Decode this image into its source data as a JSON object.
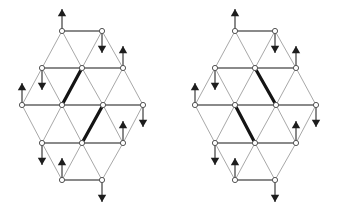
{
  "figure": {
    "canvas": {
      "width": 346,
      "height": 212,
      "background": "#ffffff"
    },
    "colors": {
      "edge_normal": "#a8a8a8",
      "edge_horizontal": "#8a8a8a",
      "edge_bold": "#141414",
      "node_fill": "#ffffff",
      "node_stroke": "#555555",
      "arrow": "#1d1d1d"
    },
    "geometry": {
      "node_radius": 2.6,
      "arrow_length": 22,
      "arrow_head_size": 4.2,
      "col_spacing": 20.3,
      "row_spacing": 18.5
    },
    "panels": [
      {
        "name": "left-lattice",
        "origin_x": 22,
        "origin_y": 31,
        "rows": [
          {
            "row": 0,
            "y": 31,
            "xs": [
              62,
              102
            ]
          },
          {
            "row": 1,
            "y": 68,
            "xs": [
              42,
              82,
              123
            ]
          },
          {
            "row": 2,
            "y": 105,
            "xs": [
              22,
              62,
              103,
              143
            ]
          },
          {
            "row": 3,
            "y": 143,
            "xs": [
              42,
              82,
              123
            ]
          },
          {
            "row": 4,
            "y": 180,
            "xs": [
              62,
              102
            ]
          }
        ],
        "horizontal_edges": [
          {
            "x1": 62,
            "y1": 31,
            "x2": 102,
            "y2": 31
          },
          {
            "x1": 42,
            "y1": 68,
            "x2": 123,
            "y2": 68
          },
          {
            "x1": 22,
            "y1": 105,
            "x2": 143,
            "y2": 105
          },
          {
            "x1": 42,
            "y1": 143,
            "x2": 123,
            "y2": 143
          },
          {
            "x1": 62,
            "y1": 180,
            "x2": 102,
            "y2": 180
          }
        ],
        "diagonal_edges": [
          {
            "x1": 62,
            "y1": 31,
            "x2": 42,
            "y2": 68
          },
          {
            "x1": 62,
            "y1": 31,
            "x2": 82,
            "y2": 68
          },
          {
            "x1": 102,
            "y1": 31,
            "x2": 82,
            "y2": 68
          },
          {
            "x1": 102,
            "y1": 31,
            "x2": 123,
            "y2": 68
          },
          {
            "x1": 42,
            "y1": 68,
            "x2": 22,
            "y2": 105
          },
          {
            "x1": 42,
            "y1": 68,
            "x2": 62,
            "y2": 105
          },
          {
            "x1": 82,
            "y1": 68,
            "x2": 62,
            "y2": 105
          },
          {
            "x1": 82,
            "y1": 68,
            "x2": 103,
            "y2": 105
          },
          {
            "x1": 123,
            "y1": 68,
            "x2": 103,
            "y2": 105
          },
          {
            "x1": 123,
            "y1": 68,
            "x2": 143,
            "y2": 105
          },
          {
            "x1": 22,
            "y1": 105,
            "x2": 42,
            "y2": 143
          },
          {
            "x1": 62,
            "y1": 105,
            "x2": 42,
            "y2": 143
          },
          {
            "x1": 62,
            "y1": 105,
            "x2": 82,
            "y2": 143
          },
          {
            "x1": 103,
            "y1": 105,
            "x2": 82,
            "y2": 143
          },
          {
            "x1": 103,
            "y1": 105,
            "x2": 123,
            "y2": 143
          },
          {
            "x1": 143,
            "y1": 105,
            "x2": 123,
            "y2": 143
          },
          {
            "x1": 42,
            "y1": 143,
            "x2": 62,
            "y2": 180
          },
          {
            "x1": 82,
            "y1": 143,
            "x2": 62,
            "y2": 180
          },
          {
            "x1": 82,
            "y1": 143,
            "x2": 102,
            "y2": 180
          },
          {
            "x1": 123,
            "y1": 143,
            "x2": 102,
            "y2": 180
          }
        ],
        "bold_edges": [
          {
            "x1": 82,
            "y1": 68,
            "x2": 62,
            "y2": 105
          },
          {
            "x1": 103,
            "y1": 105,
            "x2": 82,
            "y2": 143
          }
        ],
        "arrows": [
          {
            "x": 62,
            "y": 31,
            "dir": "up"
          },
          {
            "x": 102,
            "y": 31,
            "dir": "down"
          },
          {
            "x": 42,
            "y": 68,
            "dir": "down"
          },
          {
            "x": 123,
            "y": 68,
            "dir": "up"
          },
          {
            "x": 22,
            "y": 105,
            "dir": "up"
          },
          {
            "x": 143,
            "y": 105,
            "dir": "down"
          },
          {
            "x": 42,
            "y": 143,
            "dir": "down"
          },
          {
            "x": 123,
            "y": 143,
            "dir": "up"
          },
          {
            "x": 62,
            "y": 180,
            "dir": "up"
          },
          {
            "x": 102,
            "y": 180,
            "dir": "down"
          }
        ]
      },
      {
        "name": "right-lattice",
        "origin_x": 195,
        "origin_y": 31,
        "rows": [
          {
            "row": 0,
            "y": 31,
            "xs": [
              235,
              275
            ]
          },
          {
            "row": 1,
            "y": 68,
            "xs": [
              215,
              255,
              296
            ]
          },
          {
            "row": 2,
            "y": 105,
            "xs": [
              195,
              235,
              276,
              316
            ]
          },
          {
            "row": 3,
            "y": 143,
            "xs": [
              215,
              255,
              296
            ]
          },
          {
            "row": 4,
            "y": 180,
            "xs": [
              235,
              275
            ]
          }
        ],
        "horizontal_edges": [
          {
            "x1": 235,
            "y1": 31,
            "x2": 275,
            "y2": 31
          },
          {
            "x1": 215,
            "y1": 68,
            "x2": 296,
            "y2": 68
          },
          {
            "x1": 195,
            "y1": 105,
            "x2": 316,
            "y2": 105
          },
          {
            "x1": 215,
            "y1": 143,
            "x2": 296,
            "y2": 143
          },
          {
            "x1": 235,
            "y1": 180,
            "x2": 275,
            "y2": 180
          }
        ],
        "diagonal_edges": [
          {
            "x1": 235,
            "y1": 31,
            "x2": 215,
            "y2": 68
          },
          {
            "x1": 235,
            "y1": 31,
            "x2": 255,
            "y2": 68
          },
          {
            "x1": 275,
            "y1": 31,
            "x2": 255,
            "y2": 68
          },
          {
            "x1": 275,
            "y1": 31,
            "x2": 296,
            "y2": 68
          },
          {
            "x1": 215,
            "y1": 68,
            "x2": 195,
            "y2": 105
          },
          {
            "x1": 215,
            "y1": 68,
            "x2": 235,
            "y2": 105
          },
          {
            "x1": 255,
            "y1": 68,
            "x2": 235,
            "y2": 105
          },
          {
            "x1": 255,
            "y1": 68,
            "x2": 276,
            "y2": 105
          },
          {
            "x1": 296,
            "y1": 68,
            "x2": 276,
            "y2": 105
          },
          {
            "x1": 296,
            "y1": 68,
            "x2": 316,
            "y2": 105
          },
          {
            "x1": 195,
            "y1": 105,
            "x2": 215,
            "y2": 143
          },
          {
            "x1": 235,
            "y1": 105,
            "x2": 215,
            "y2": 143
          },
          {
            "x1": 235,
            "y1": 105,
            "x2": 255,
            "y2": 143
          },
          {
            "x1": 276,
            "y1": 105,
            "x2": 255,
            "y2": 143
          },
          {
            "x1": 276,
            "y1": 105,
            "x2": 296,
            "y2": 143
          },
          {
            "x1": 316,
            "y1": 105,
            "x2": 296,
            "y2": 143
          },
          {
            "x1": 215,
            "y1": 143,
            "x2": 235,
            "y2": 180
          },
          {
            "x1": 255,
            "y1": 143,
            "x2": 235,
            "y2": 180
          },
          {
            "x1": 255,
            "y1": 143,
            "x2": 275,
            "y2": 180
          },
          {
            "x1": 296,
            "y1": 143,
            "x2": 275,
            "y2": 180
          }
        ],
        "bold_edges": [
          {
            "x1": 255,
            "y1": 68,
            "x2": 276,
            "y2": 105
          },
          {
            "x1": 235,
            "y1": 105,
            "x2": 255,
            "y2": 143
          }
        ],
        "arrows": [
          {
            "x": 235,
            "y": 31,
            "dir": "up"
          },
          {
            "x": 275,
            "y": 31,
            "dir": "down"
          },
          {
            "x": 215,
            "y": 68,
            "dir": "down"
          },
          {
            "x": 296,
            "y": 68,
            "dir": "up"
          },
          {
            "x": 195,
            "y": 105,
            "dir": "up"
          },
          {
            "x": 316,
            "y": 105,
            "dir": "down"
          },
          {
            "x": 215,
            "y": 143,
            "dir": "down"
          },
          {
            "x": 296,
            "y": 143,
            "dir": "up"
          },
          {
            "x": 235,
            "y": 180,
            "dir": "up"
          },
          {
            "x": 275,
            "y": 180,
            "dir": "down"
          }
        ]
      }
    ]
  }
}
